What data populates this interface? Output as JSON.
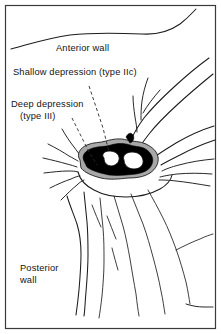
{
  "figure": {
    "background_color": "#ffffff",
    "frame_color": "#3a3a3a",
    "ink_color": "#1c1c1c",
    "deep_depression_color": "#000000",
    "halo_color": "#a8a8a8",
    "width": 221,
    "height": 334
  },
  "labels": {
    "anterior_wall": "Anterior  wall",
    "shallow_depression": "Shallow depression (type IIc)",
    "deep_depression_line1": "Deep depression",
    "deep_depression_line2": "(type III)",
    "posterior_wall_line1": "Posterior",
    "posterior_wall_line2": "wall"
  }
}
